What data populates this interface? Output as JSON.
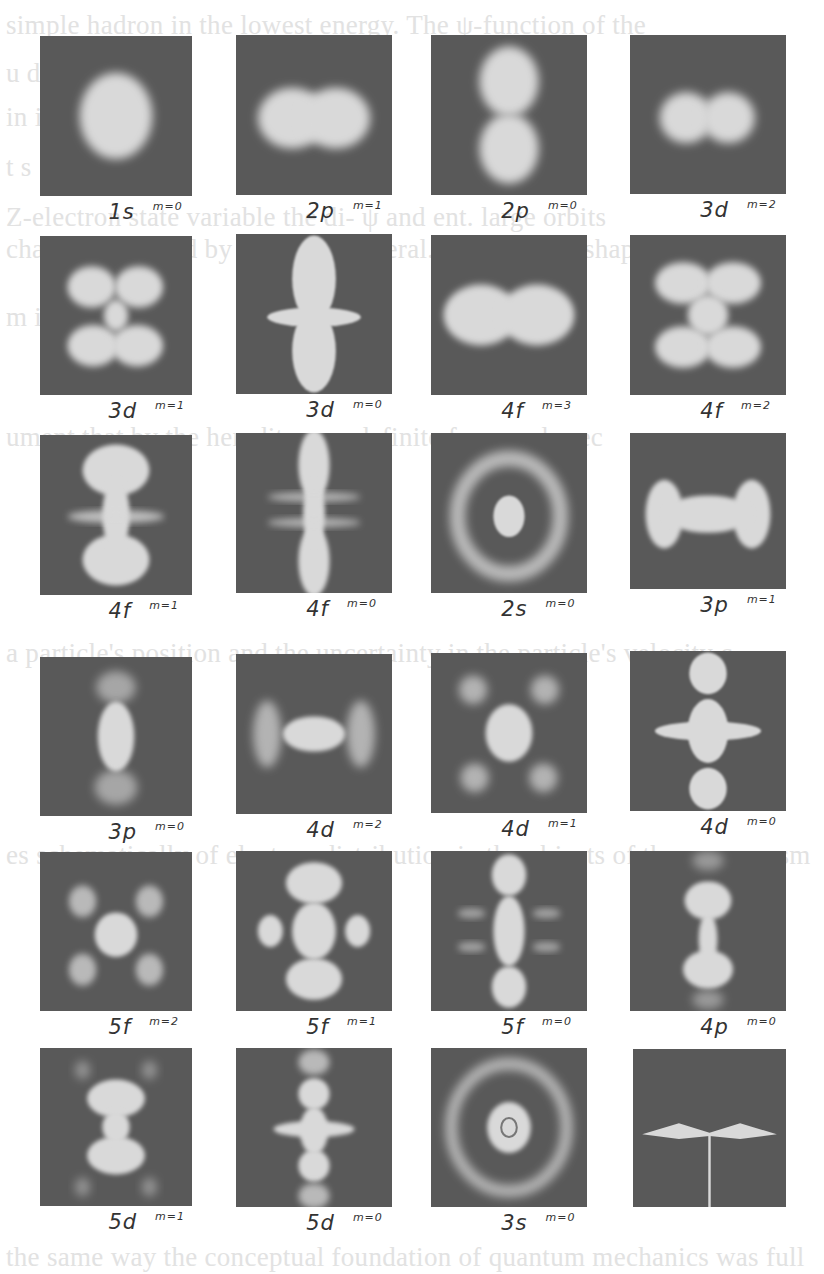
{
  "figure": {
    "panel_color": "#595959",
    "blob_color": "#d9d9d9",
    "panels": [
      {
        "n": "1s",
        "m": "m=0",
        "x": 40,
        "y": 36,
        "w": 152,
        "h": 160,
        "shape": "sphere"
      },
      {
        "n": "2p",
        "m": "m=1",
        "x": 236,
        "y": 35,
        "w": 156,
        "h": 160,
        "shape": "torus-h"
      },
      {
        "n": "2p",
        "m": "m=0",
        "x": 431,
        "y": 35,
        "w": 156,
        "h": 160,
        "shape": "dumbbell-v"
      },
      {
        "n": "3d",
        "m": "m=2",
        "x": 630,
        "y": 35,
        "w": 156,
        "h": 159,
        "shape": "double-h"
      },
      {
        "n": "3d",
        "m": "m=1",
        "x": 40,
        "y": 236,
        "w": 152,
        "h": 159,
        "shape": "x4"
      },
      {
        "n": "3d",
        "m": "m=0",
        "x": 236,
        "y": 234,
        "w": 156,
        "h": 160,
        "shape": "dz2"
      },
      {
        "n": "4f",
        "m": "m=3",
        "x": 431,
        "y": 235,
        "w": 156,
        "h": 160,
        "shape": "wide-h"
      },
      {
        "n": "4f",
        "m": "m=2",
        "x": 630,
        "y": 235,
        "w": 156,
        "h": 160,
        "shape": "butterfly"
      },
      {
        "n": "4f",
        "m": "m=1",
        "x": 40,
        "y": 435,
        "w": 152,
        "h": 160,
        "shape": "hourglass"
      },
      {
        "n": "4f",
        "m": "m=0",
        "x": 236,
        "y": 433,
        "w": 156,
        "h": 160,
        "shape": "fz3"
      },
      {
        "n": "2s",
        "m": "m=0",
        "x": 431,
        "y": 433,
        "w": 156,
        "h": 160,
        "shape": "ring1"
      },
      {
        "n": "3p",
        "m": "m=1",
        "x": 630,
        "y": 433,
        "w": 156,
        "h": 156,
        "shape": "bone-h"
      },
      {
        "n": "3p",
        "m": "m=0",
        "x": 40,
        "y": 657,
        "w": 152,
        "h": 159,
        "shape": "p3v"
      },
      {
        "n": "4d",
        "m": "m=2",
        "x": 236,
        "y": 654,
        "w": 156,
        "h": 160,
        "shape": "d4h"
      },
      {
        "n": "4d",
        "m": "m=1",
        "x": 431,
        "y": 653,
        "w": 156,
        "h": 160,
        "shape": "d4x"
      },
      {
        "n": "4d",
        "m": "m=0",
        "x": 630,
        "y": 651,
        "w": 156,
        "h": 160,
        "shape": "d4z"
      },
      {
        "n": "5f",
        "m": "m=2",
        "x": 40,
        "y": 852,
        "w": 152,
        "h": 159,
        "shape": "f5x"
      },
      {
        "n": "5f",
        "m": "m=1",
        "x": 236,
        "y": 851,
        "w": 156,
        "h": 160,
        "shape": "f5c"
      },
      {
        "n": "5f",
        "m": "m=0",
        "x": 431,
        "y": 851,
        "w": 156,
        "h": 160,
        "shape": "f5z"
      },
      {
        "n": "4p",
        "m": "m=0",
        "x": 630,
        "y": 851,
        "w": 156,
        "h": 160,
        "shape": "p4v"
      },
      {
        "n": "5d",
        "m": "m=1",
        "x": 40,
        "y": 1048,
        "w": 152,
        "h": 158,
        "shape": "d5x"
      },
      {
        "n": "5d",
        "m": "m=0",
        "x": 236,
        "y": 1048,
        "w": 156,
        "h": 159,
        "shape": "d5z"
      },
      {
        "n": "3s",
        "m": "m=0",
        "x": 431,
        "y": 1048,
        "w": 156,
        "h": 159,
        "shape": "ring2"
      },
      {
        "n": "",
        "m": "",
        "x": 633,
        "y": 1049,
        "w": 153,
        "h": 158,
        "shape": "line"
      }
    ]
  },
  "background_text": [
    {
      "y": 8,
      "text": "simple hadron       in the lowest       energy. The ψ-function of the"
    },
    {
      "y": 56,
      "text": "         u                     d                       o"
    },
    {
      "y": 100,
      "text": "in        id                  a                         m"
    },
    {
      "y": 150,
      "text": "t                                                       s"
    },
    {
      "y": 200,
      "text": "Z-electron state variable the di-     ψ and ent.    large orbits"
    },
    {
      "y": 232,
      "text": "charged stuff and by matter in general. Here are the shapes at"
    },
    {
      "y": 300,
      "text": "    m                                                 ia  n"
    },
    {
      "y": 420,
      "text": "ument that  by the heredit       some definite form and prec"
    },
    {
      "y": 636,
      "text": "a particle's position and the uncertainty in the particle's velocity c"
    },
    {
      "y": 838,
      "text": "es schematically of electron distribution in the objects of the macrocosm"
    },
    {
      "y": 1240,
      "text": "the same way the conceptual foundation of quantum mechanics was full"
    }
  ]
}
